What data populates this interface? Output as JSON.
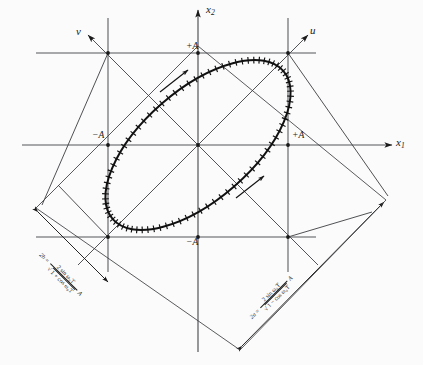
{
  "figure": {
    "type": "phase-plane-trajectory-diagram",
    "background_color": "#fbfbfb",
    "ink_color": "#1a1a1a",
    "grid_color": "#55565a"
  },
  "axes": {
    "x1": {
      "label": "x",
      "subscript": "1",
      "name": "horizontal-axis"
    },
    "x2": {
      "label": "x",
      "subscript": "2",
      "name": "vertical-axis"
    },
    "u": {
      "label": "u",
      "name": "rotated-axis-u",
      "angle_deg": 45
    },
    "v": {
      "label": "v",
      "name": "rotated-axis-v",
      "angle_deg": 135
    }
  },
  "ticks": {
    "x2_positive": "+A",
    "x2_negative": "−A",
    "x1_positive": "+A",
    "x1_negative": "−A"
  },
  "dimensions": {
    "minor": {
      "name": "2b",
      "lhs": "2b",
      "equals": "=",
      "numerator": "2 sin ω₀T",
      "radical": "√",
      "denominator": "1 + cos ω₀T",
      "trailing": "A",
      "full": "2b = 2 sin ω₀T / √(1 + cos ω₀T) · A"
    },
    "major": {
      "name": "2a",
      "lhs": "2a",
      "equals": "=",
      "numerator": "2 sin ω₀T",
      "radical": "√",
      "denominator": "1 − cos ω₀T",
      "trailing": "A",
      "full": "2a = 2 sin ω₀T / √(1 − cos ω₀T) · A"
    }
  },
  "chart_data": {
    "type": "scatter",
    "title": "",
    "xlabel": "x1",
    "ylabel": "x2",
    "series": [
      {
        "name": "elliptical trajectory",
        "shape": "ellipse",
        "center": [
          0,
          0
        ],
        "semi_major": 1.62,
        "semi_minor": 0.78,
        "rotation_deg": 45,
        "amplitude_A": 1.0,
        "marker": "hash-tick",
        "direction": "counterclockwise"
      }
    ],
    "annotations": [
      "+A",
      "−A",
      "+A",
      "−A",
      "2b = 2 sin ω₀T / √(1 + cos ω₀T) A",
      "2a = 2 sin ω₀T / √(1 − cos ω₀T) A"
    ],
    "grid": true,
    "legend": "none"
  }
}
